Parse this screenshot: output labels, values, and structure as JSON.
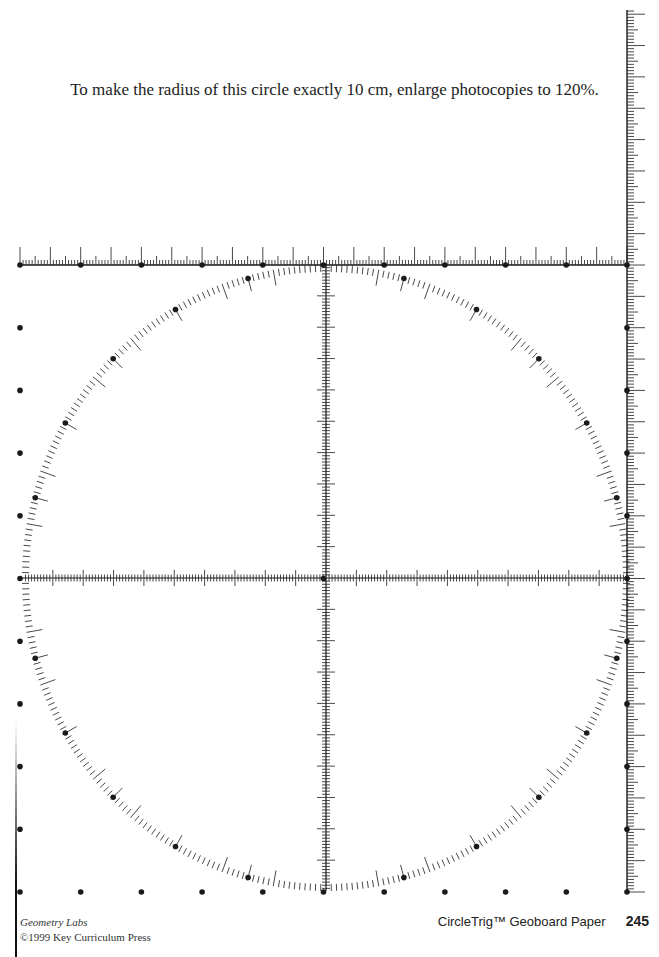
{
  "instruction": "To make the radius of this circle exactly 10 cm, enlarge photocopies to 120%.",
  "footer": {
    "series": "Geometry Labs",
    "copyright": "©1999 Key Curriculum Press",
    "title": "CircleTrig™ Geoboard Paper",
    "page_number": "245"
  },
  "figure": {
    "center": [
      326,
      578
    ],
    "radius_x": 304,
    "radius_y": 313,
    "grid": {
      "cols": 11,
      "rows": 11,
      "x0": 20,
      "y0": 265,
      "dx": 60.7,
      "dy": 62.7
    },
    "circle_ticks": {
      "minor_deg": 1,
      "long_every_deg": 10,
      "dot_every_deg": 15
    },
    "rulers": {
      "top": {
        "y": 265,
        "x_start": 20,
        "x_end": 627
      },
      "right": {
        "x": 627,
        "y_start": 10,
        "y_end": 892
      },
      "axes": "center crosshair with tick marks"
    },
    "ink_color": "#1a1a1a"
  }
}
